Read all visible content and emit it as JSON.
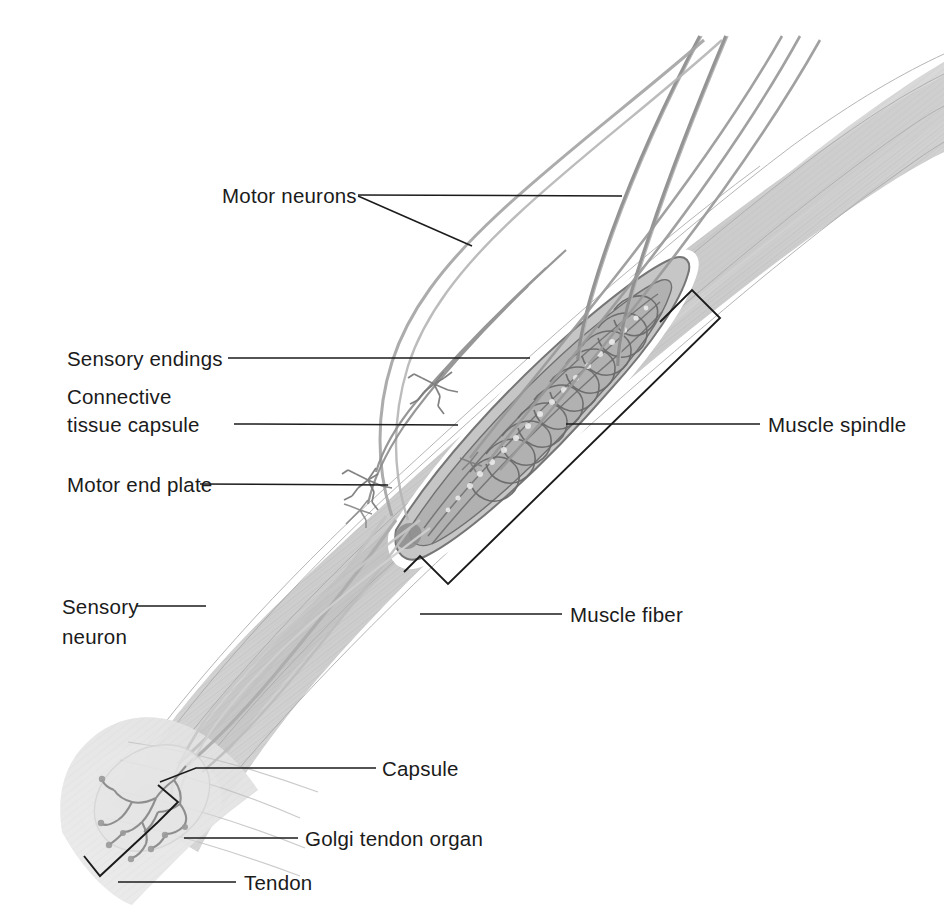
{
  "figure": {
    "background_color": "#ffffff",
    "line_color": "#1b1b1b",
    "muscle_color": "#c9c9c9",
    "muscle_dark_color": "#9a9a9a",
    "nerve_color": "#8a8a8a",
    "capsule_highlight_color": "#ffffff",
    "width": 944,
    "height": 915
  },
  "labels": {
    "motor_neurons": "Motor neurons",
    "sensory_endings": "Sensory endings",
    "connective_line1": "Connective",
    "connective_line2": "tissue capsule",
    "motor_end_plate": "Motor end plate",
    "sensory_line1": "Sensory",
    "sensory_line2": "neuron",
    "muscle_spindle": "Muscle spindle",
    "muscle_fiber": "Muscle fiber",
    "capsule": "Capsule",
    "golgi_tendon_organ": "Golgi tendon organ",
    "tendon": "Tendon"
  }
}
